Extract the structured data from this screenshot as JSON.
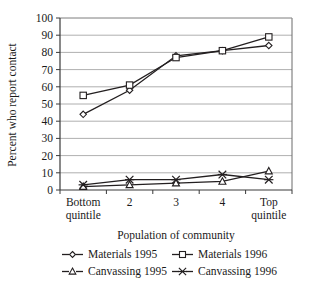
{
  "chart_data": {
    "type": "line",
    "title": "",
    "xlabel": "Population of community",
    "ylabel": "Percent who report contact",
    "categories": [
      "Bottom quintile",
      "2",
      "3",
      "4",
      "Top quintile"
    ],
    "ylim": [
      0,
      100
    ],
    "ytick_labels": [
      "0",
      "10",
      "20",
      "30",
      "40",
      "50",
      "60",
      "70",
      "80",
      "90",
      "100"
    ],
    "yticks": [
      0,
      10,
      20,
      30,
      40,
      50,
      60,
      70,
      80,
      90,
      100
    ],
    "grid": true,
    "legend_position": "bottom",
    "series": [
      {
        "name": "Materials 1995",
        "marker": "diamond",
        "values": [
          44,
          58,
          78,
          81,
          84
        ]
      },
      {
        "name": "Materials 1996",
        "marker": "square",
        "values": [
          55,
          61,
          77,
          81,
          89
        ]
      },
      {
        "name": "Canvassing 1995",
        "marker": "triangle",
        "values": [
          2,
          3,
          4,
          5,
          11
        ]
      },
      {
        "name": "Canvassing 1996",
        "marker": "cross",
        "values": [
          3,
          6,
          6,
          9,
          6
        ]
      }
    ]
  },
  "legend": {
    "entries": [
      {
        "label": "Materials 1995",
        "marker": "diamond"
      },
      {
        "label": "Materials 1996",
        "marker": "square"
      },
      {
        "label": "Canvassing 1995",
        "marker": "triangle"
      },
      {
        "label": "Canvassing 1996",
        "marker": "cross"
      }
    ]
  },
  "colors": {
    "line": "#231f20",
    "grid": "#9a9a9a",
    "frame": "#6b6b6b",
    "marker_fill": "#ffffff",
    "text": "#1a1a1a",
    "background": "#ffffff"
  }
}
